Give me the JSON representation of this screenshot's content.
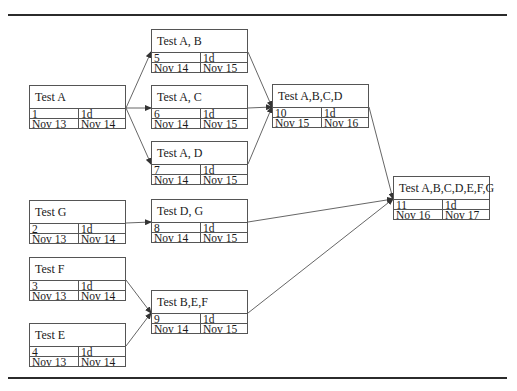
{
  "diagram": {
    "type": "network-precedence-diagram",
    "nodes": [
      {
        "id": "n1",
        "title": "Test A",
        "id_num": "1",
        "duration": "1d",
        "start": "Nov 13",
        "finish": "Nov 14",
        "x": 29,
        "y": 85
      },
      {
        "id": "n2",
        "title": "Test G",
        "id_num": "2",
        "duration": "1d",
        "start": "Nov 13",
        "finish": "Nov 14",
        "x": 29,
        "y": 200
      },
      {
        "id": "n3",
        "title": "Test F",
        "id_num": "3",
        "duration": "1d",
        "start": "Nov 13",
        "finish": "Nov 14",
        "x": 29,
        "y": 257
      },
      {
        "id": "n4",
        "title": "Test E",
        "id_num": "4",
        "duration": "1d",
        "start": "Nov 13",
        "finish": "Nov 14",
        "x": 29,
        "y": 323
      },
      {
        "id": "n5",
        "title": "Test A, B",
        "id_num": "5",
        "duration": "1d",
        "start": "Nov 14",
        "finish": "Nov 15",
        "x": 151,
        "y": 29
      },
      {
        "id": "n6",
        "title": "Test A, C",
        "id_num": "6",
        "duration": "1d",
        "start": "Nov 14",
        "finish": "Nov 15",
        "x": 151,
        "y": 85
      },
      {
        "id": "n7",
        "title": "Test A, D",
        "id_num": "7",
        "duration": "1d",
        "start": "Nov 14",
        "finish": "Nov 15",
        "x": 151,
        "y": 141
      },
      {
        "id": "n8",
        "title": "Test D, G",
        "id_num": "8",
        "duration": "1d",
        "start": "Nov 14",
        "finish": "Nov 15",
        "x": 151,
        "y": 199
      },
      {
        "id": "n9",
        "title": "Test B,E,F",
        "id_num": "9",
        "duration": "1d",
        "start": "Nov 14",
        "finish": "Nov 15",
        "x": 151,
        "y": 290
      },
      {
        "id": "n10",
        "title": "Test A,B,C,D",
        "id_num": "10",
        "duration": "1d",
        "start": "Nov 15",
        "finish": "Nov 16",
        "x": 272,
        "y": 84
      },
      {
        "id": "n11",
        "title": "Test A,B,C,D,E,F,G",
        "id_num": "11",
        "duration": "1d",
        "start": "Nov 16",
        "finish": "Nov 17",
        "x": 393,
        "y": 176
      }
    ],
    "edges": [
      {
        "from": "n1",
        "to": "n5"
      },
      {
        "from": "n1",
        "to": "n6"
      },
      {
        "from": "n1",
        "to": "n7"
      },
      {
        "from": "n2",
        "to": "n8"
      },
      {
        "from": "n3",
        "to": "n9"
      },
      {
        "from": "n4",
        "to": "n9"
      },
      {
        "from": "n5",
        "to": "n10"
      },
      {
        "from": "n6",
        "to": "n10"
      },
      {
        "from": "n7",
        "to": "n10"
      },
      {
        "from": "n10",
        "to": "n11"
      },
      {
        "from": "n8",
        "to": "n11"
      },
      {
        "from": "n9",
        "to": "n11"
      }
    ],
    "colors": {
      "line": "#555555",
      "rule": "#2b2b2b",
      "background": "#ffffff"
    }
  }
}
